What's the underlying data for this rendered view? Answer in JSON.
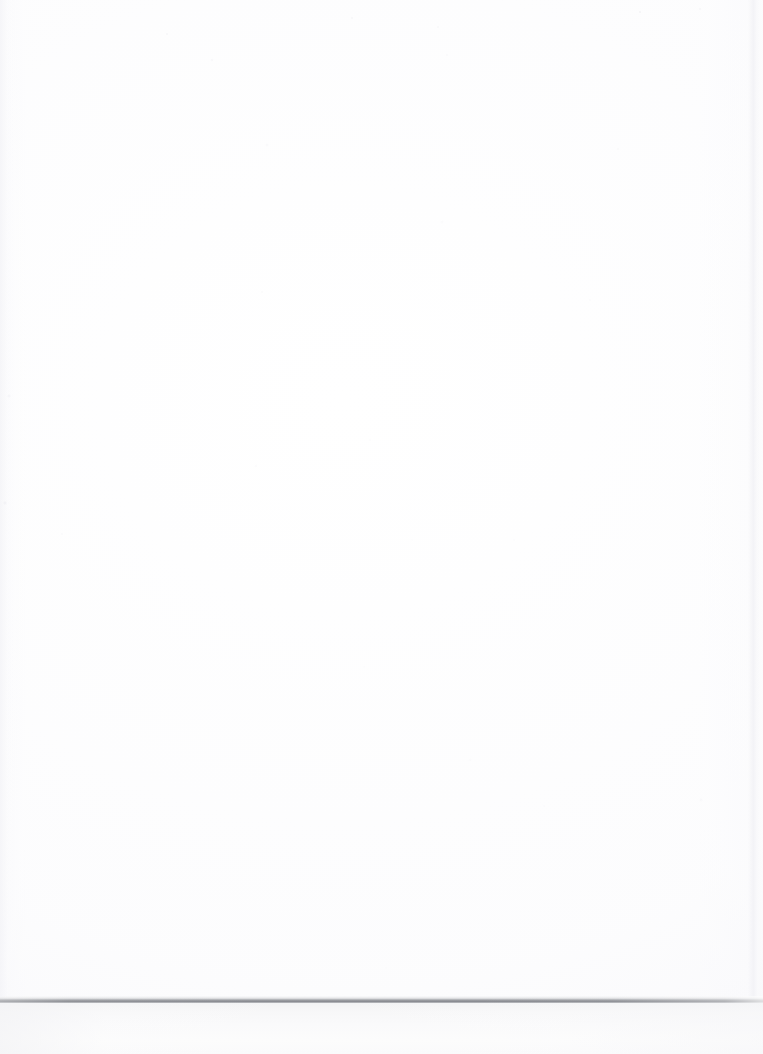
{
  "document": {
    "kind": "scanned-page",
    "page_content": "",
    "is_blank": true,
    "visible_text": []
  },
  "scan": {
    "width_px": 763,
    "height_px": 1054,
    "page_area": {
      "top_px": 0,
      "height_px": 1000,
      "fill_color": "#fdfdfe"
    },
    "bottom_edge_line": {
      "name": "page-bottom-edge",
      "top_px": 998,
      "thickness_px": 4,
      "color": "#8a8c92",
      "spans_full_width": true
    },
    "right_edge_seam": {
      "name": "page-right-edge",
      "left_px": 752,
      "color": "#f2f2f6"
    },
    "background_strip": {
      "name": "scanner-background",
      "top_px": 1003,
      "height_px": 51,
      "color": "#f6f6f7"
    }
  }
}
